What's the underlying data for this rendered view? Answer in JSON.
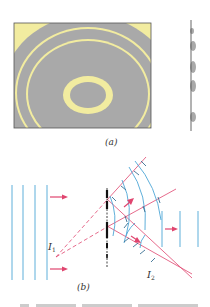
{
  "figure": {
    "panel_a": {
      "caption": "(a)",
      "description": "zone plate pattern with alternating transparent and opaque rings, plus edge-on profile",
      "colors": {
        "background": "#f2eca0",
        "opaque_ring": "#a9a9a9",
        "border": "#555555"
      }
    },
    "panel_b": {
      "caption": "(b)",
      "labels": {
        "source_point": "I",
        "source_sub": "1",
        "image_point": "I",
        "image_sub": "2"
      },
      "colors": {
        "wavefront": "#4da6d6",
        "ray": "#e0456f",
        "plate": "#111111"
      }
    },
    "footer_text_cropped": true
  }
}
